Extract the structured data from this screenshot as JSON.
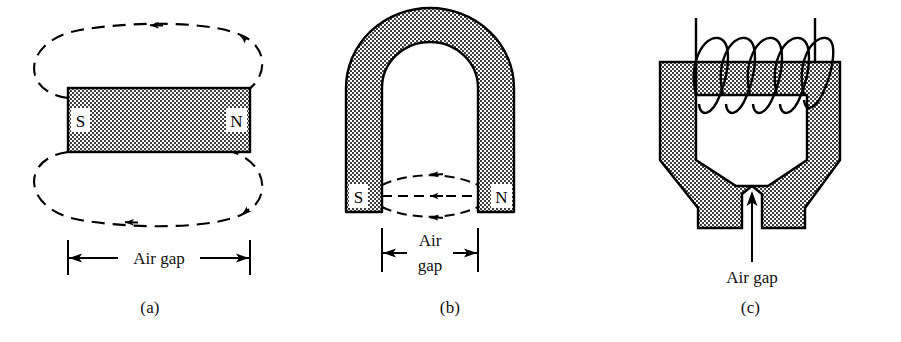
{
  "figure": {
    "panels": [
      {
        "id": "a",
        "caption": "(a)",
        "type": "bar-magnet",
        "labels": {
          "south": "S",
          "north": "N",
          "gap": "Air  gap"
        },
        "flux_loops": 2,
        "flux_direction": "N-to-S external",
        "description": "Bar magnet with dashed external flux loops above and below"
      },
      {
        "id": "b",
        "caption": "(b)",
        "type": "horseshoe-magnet",
        "labels": {
          "south": "S",
          "north": "N",
          "gap_line1": "Air",
          "gap_line2": "gap"
        },
        "field_lines": 3,
        "field_direction": "N-to-S across gap",
        "description": "Horseshoe magnet with three dashed field lines crossing the air gap"
      },
      {
        "id": "c",
        "caption": "(c)",
        "type": "electromagnet-c-core",
        "labels": {
          "gap": "Air gap"
        },
        "coil_turns": 5,
        "lead_wires": 2,
        "description": "C-core electromagnet with excitation coil and tapered pole pieces"
      }
    ]
  },
  "colors": {
    "ink": "#000000",
    "caption": "#111111",
    "stipple_dark": "#3a3a3a",
    "stipple_light": "#ffffff",
    "paper": "#ffffff"
  }
}
